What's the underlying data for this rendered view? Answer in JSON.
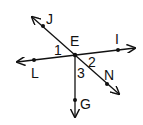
{
  "diagram": {
    "type": "geometry-lines-angles",
    "center_point": "E",
    "points": [
      {
        "name": "E",
        "label": "E",
        "x": 75,
        "y": 55
      },
      {
        "name": "J",
        "label": "J",
        "x": 43,
        "y": 26
      },
      {
        "name": "I",
        "label": "I",
        "x": 118,
        "y": 50
      },
      {
        "name": "L",
        "label": "L",
        "x": 34,
        "y": 60
      },
      {
        "name": "N",
        "label": "N",
        "x": 107,
        "y": 84
      },
      {
        "name": "G",
        "label": "G",
        "x": 75,
        "y": 100
      }
    ],
    "lines": [
      {
        "name": "line-LI",
        "through": [
          "L",
          "E",
          "I"
        ]
      },
      {
        "name": "line-JN",
        "through": [
          "J",
          "E",
          "N"
        ]
      },
      {
        "name": "ray-EG",
        "through": [
          "E",
          "G"
        ]
      }
    ],
    "angles": [
      {
        "label": "1",
        "between": [
          "J",
          "E",
          "L"
        ]
      },
      {
        "label": "2",
        "between": [
          "I",
          "E",
          "N"
        ]
      },
      {
        "label": "3",
        "between": [
          "N",
          "E",
          "G"
        ]
      }
    ],
    "colors": {
      "stroke": "#111111",
      "background": "#ffffff"
    }
  }
}
